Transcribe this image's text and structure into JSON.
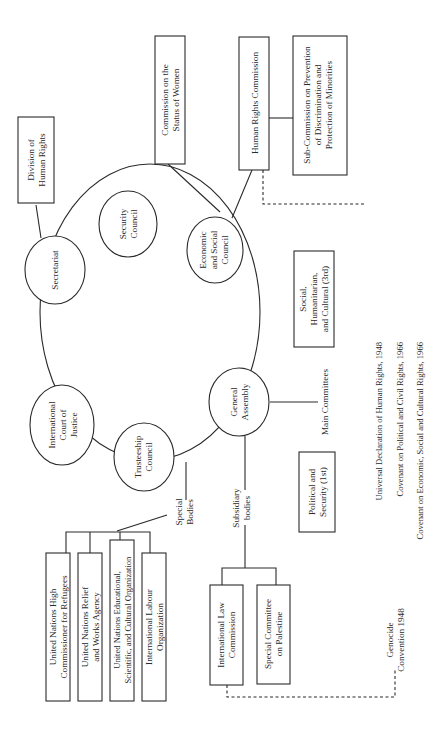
{
  "diagram": {
    "orientation": "rotated-90-ccw",
    "colors": {
      "ink": "#2a2a2a",
      "background": "#ffffff"
    },
    "principal_organs": [
      {
        "id": "secretariat",
        "lines": [
          "Secretariat"
        ]
      },
      {
        "id": "security_council",
        "lines": [
          "Security",
          "Council"
        ]
      },
      {
        "id": "ecosoc",
        "lines": [
          "Economic",
          "and Social",
          "Council"
        ]
      },
      {
        "id": "general_assembly",
        "lines": [
          "General",
          "Assembly"
        ]
      },
      {
        "id": "trusteeship",
        "lines": [
          "Trusteeship",
          "Council"
        ]
      },
      {
        "id": "icj",
        "lines": [
          "International",
          "Court of",
          "Justice"
        ]
      }
    ],
    "secretariat_children": [
      {
        "id": "division_hr",
        "lines": [
          "Division of",
          "Human Rights"
        ]
      }
    ],
    "ecosoc_children": [
      {
        "id": "csw",
        "lines": [
          "Commission on the",
          "Status of Women"
        ]
      },
      {
        "id": "hrc",
        "lines": [
          "Human Rights Commission"
        ]
      }
    ],
    "hrc_children": [
      {
        "id": "subcommission",
        "lines": [
          "Sub-Commission on Prevention",
          "of Discrimination and",
          "Protection of Minorities"
        ]
      }
    ],
    "hrc_instruments": [
      "Universal Declaration of Human Rights, 1948",
      "Covenant on Political and Civil Rights, 1966",
      "Covenant on Economic, Social and Cultural Rights, 1966"
    ],
    "main_committees": {
      "label": "Main Committees",
      "items": [
        {
          "id": "third_committee",
          "lines": [
            "Social,",
            "Humanitarian,",
            "and Cultural (3rd)"
          ]
        },
        {
          "id": "first_committee",
          "lines": [
            "Political and",
            "Security (1st)"
          ]
        }
      ]
    },
    "subsidiary_bodies": {
      "label_lines": [
        "Subsidiary",
        "bodies"
      ],
      "items": [
        {
          "id": "ilc",
          "lines": [
            "International Law",
            "Commission"
          ]
        },
        {
          "id": "scp",
          "lines": [
            "Special Committee",
            "on Palestine"
          ]
        }
      ]
    },
    "ilc_instrument": {
      "lines": [
        "Genocide",
        "Convention 1948"
      ]
    },
    "special_bodies": {
      "label_lines": [
        "Special",
        "Bodies"
      ],
      "items": [
        {
          "id": "unhcr",
          "lines": [
            "United Nations High",
            "Commissioner for Refugees"
          ]
        },
        {
          "id": "unrwa",
          "lines": [
            "United Nations Relief",
            "and Works Agency"
          ]
        },
        {
          "id": "unesco",
          "lines": [
            "United Nations Educational,",
            "Scientific, and Cultural Organization"
          ]
        },
        {
          "id": "ilo",
          "lines": [
            "International Labour",
            "Organization"
          ]
        }
      ]
    }
  }
}
